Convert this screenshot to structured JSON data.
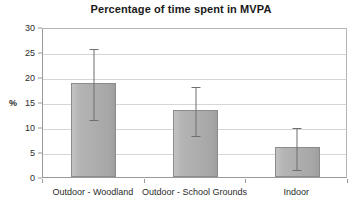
{
  "chart_data": {
    "type": "bar",
    "title": "Percentage of time spent in MVPA",
    "xlabel": "",
    "ylabel": "%",
    "categories": [
      "Outdoor - Woodland",
      "Outdoor - School Grounds",
      "Indoor"
    ],
    "values": [
      18.8,
      13.5,
      6.0
    ],
    "error_upper": [
      26.0,
      18.4,
      10.2
    ],
    "error_lower": [
      11.8,
      8.6,
      1.8
    ],
    "ylim": [
      0,
      30
    ],
    "yticks": [
      0,
      5,
      10,
      15,
      20,
      25,
      30
    ],
    "ytick_labels": [
      "0",
      "5",
      "10",
      "15",
      "20",
      "25",
      "30"
    ],
    "grid": true,
    "legend": "none",
    "series": [
      {
        "name": "Percentage of time spent in MVPA",
        "values": [
          18.8,
          13.5,
          6.0
        ],
        "color": "#adadad"
      }
    ],
    "colors": {
      "bar_fill": "#adadad",
      "bar_border": "#8c8c8c",
      "gridline": "#d6d6d6",
      "axis": "#9a9a9a",
      "errorbar": "#6f6f6f",
      "text": "#2b2b2b",
      "background": "#ffffff"
    }
  }
}
